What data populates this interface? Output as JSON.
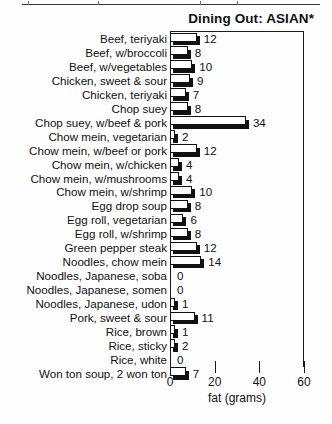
{
  "chart_data": {
    "type": "bar",
    "orientation": "horizontal",
    "title": "Dining Out: ASIAN*",
    "xlabel": "fat (grams)",
    "ylabel": "",
    "xlim": [
      0,
      60
    ],
    "xticks": [
      0,
      20,
      40,
      60
    ],
    "xtick_labels": [
      "0",
      "20",
      "40",
      "60"
    ],
    "grid": false,
    "legend": null,
    "categories": [
      "Beef, teriyaki",
      "Beef, w/broccoli",
      "Beef, w/vegetables",
      "Chicken, sweet & sour",
      "Chicken, teriyaki",
      "Chop suey",
      "Chop suey, w/beef & pork",
      "Chow mein, vegetarian",
      "Chow mein, w/beef or pork",
      "Chow mein, w/chicken",
      "Chow mein, w/mushrooms",
      "Chow mein, w/shrimp",
      "Egg drop soup",
      "Egg roll, vegetarian",
      "Egg roll, w/shrimp",
      "Green pepper steak",
      "Noodles, chow mein",
      "Noodles, Japanese, soba",
      "Noodles, Japanese, somen",
      "Noodles, Japanese, udon",
      "Pork, sweet & sour",
      "Rice, brown",
      "Rice, sticky",
      "Rice, white",
      "Won ton soup, 2 won ton"
    ],
    "values": [
      12,
      8,
      10,
      9,
      7,
      8,
      34,
      2,
      12,
      4,
      4,
      10,
      8,
      6,
      8,
      12,
      14,
      0,
      0,
      1,
      11,
      1,
      2,
      0,
      7
    ],
    "value_labels": [
      "12",
      "8",
      "10",
      "9",
      "7",
      "8",
      "34",
      "2",
      "12",
      "4",
      "4",
      "10",
      "8",
      "6",
      "8",
      "12",
      "14",
      "0",
      "0",
      "1",
      "11",
      "1",
      "2",
      "0",
      "7"
    ]
  },
  "colors": {
    "bar_fill": "#ffffff",
    "bar_outline": "#111111",
    "bar_shadow": "#111111",
    "axis": "#1a1a1a",
    "text": "#111111",
    "background": "#fefefe"
  }
}
